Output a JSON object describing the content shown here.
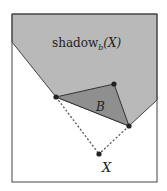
{
  "diagram": {
    "shadow_label": "shadow",
    "shadow_subscript": "b",
    "shadow_arg": "(X)",
    "triangle_label": "B",
    "point_label": "X",
    "colors": {
      "shadow_fill": "#b9b9b9",
      "triangle_fill": "#8f8f8f",
      "frame": "#444444",
      "point": "#222222",
      "dashed": "#555555"
    }
  }
}
